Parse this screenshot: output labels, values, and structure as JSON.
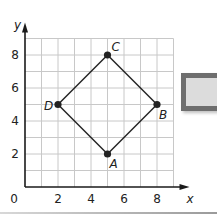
{
  "chart_data": {
    "type": "scatter",
    "title": "",
    "xlabel": "x",
    "ylabel": "y",
    "xlim": [
      0,
      9
    ],
    "ylim": [
      0,
      9
    ],
    "grid": true,
    "x_ticks": [
      2,
      4,
      6,
      8
    ],
    "y_ticks": [
      2,
      4,
      6,
      8
    ],
    "origin_label": "0",
    "points": [
      {
        "label": "A",
        "x": 5,
        "y": 2
      },
      {
        "label": "B",
        "x": 8,
        "y": 5
      },
      {
        "label": "C",
        "x": 5,
        "y": 8
      },
      {
        "label": "D",
        "x": 2,
        "y": 5
      }
    ],
    "polygon": [
      "A",
      "B",
      "C",
      "D"
    ]
  },
  "colors": {
    "grid": "#c8c8c8",
    "ink": "#222222",
    "box_border": "#6e6e6e",
    "box_fill": "#dcdcdc"
  }
}
